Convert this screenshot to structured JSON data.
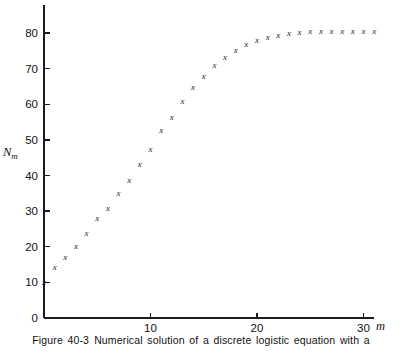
{
  "caption": {
    "figure_number": "Figure 40-3",
    "text": "Numerical solution of a discrete logistic equation with a"
  },
  "chart_data": {
    "type": "scatter",
    "title": "",
    "xlabel": "m",
    "ylabel": "N_m",
    "ylabel_base": "N",
    "ylabel_sub": "m",
    "xlim": [
      0,
      33
    ],
    "ylim": [
      0,
      87
    ],
    "xticks": [
      10,
      20,
      30
    ],
    "xtick_labels": [
      "10",
      "20",
      "30"
    ],
    "yticks": [
      0,
      10,
      20,
      30,
      40,
      50,
      60,
      70,
      80
    ],
    "ytick_labels": [
      "0",
      "10",
      "20",
      "30",
      "40",
      "50",
      "60",
      "70",
      "80"
    ],
    "grid": false,
    "legend": false,
    "marker": "x",
    "marker_color": "#1b1b1b",
    "axis_color": "#1b1b1b",
    "series": [
      {
        "name": "N_m",
        "x": [
          0,
          1,
          2,
          3,
          4,
          5,
          6,
          7,
          8,
          9,
          10,
          11,
          12,
          13,
          14,
          15,
          16,
          17,
          18,
          19,
          20,
          21,
          22,
          23,
          24,
          25,
          26,
          27,
          28,
          29,
          30,
          31
        ],
        "values": [
          10.0,
          14.3,
          17.0,
          20.3,
          24.0,
          28.0,
          31.0,
          35.0,
          38.8,
          43.3,
          47.5,
          52.8,
          56.5,
          61.0,
          64.8,
          67.8,
          71.0,
          73.3,
          75.3,
          76.8,
          78.0,
          78.8,
          79.5,
          80.0,
          80.3,
          80.5,
          80.5,
          80.5,
          80.5,
          80.5,
          80.5,
          80.5
        ]
      }
    ]
  }
}
